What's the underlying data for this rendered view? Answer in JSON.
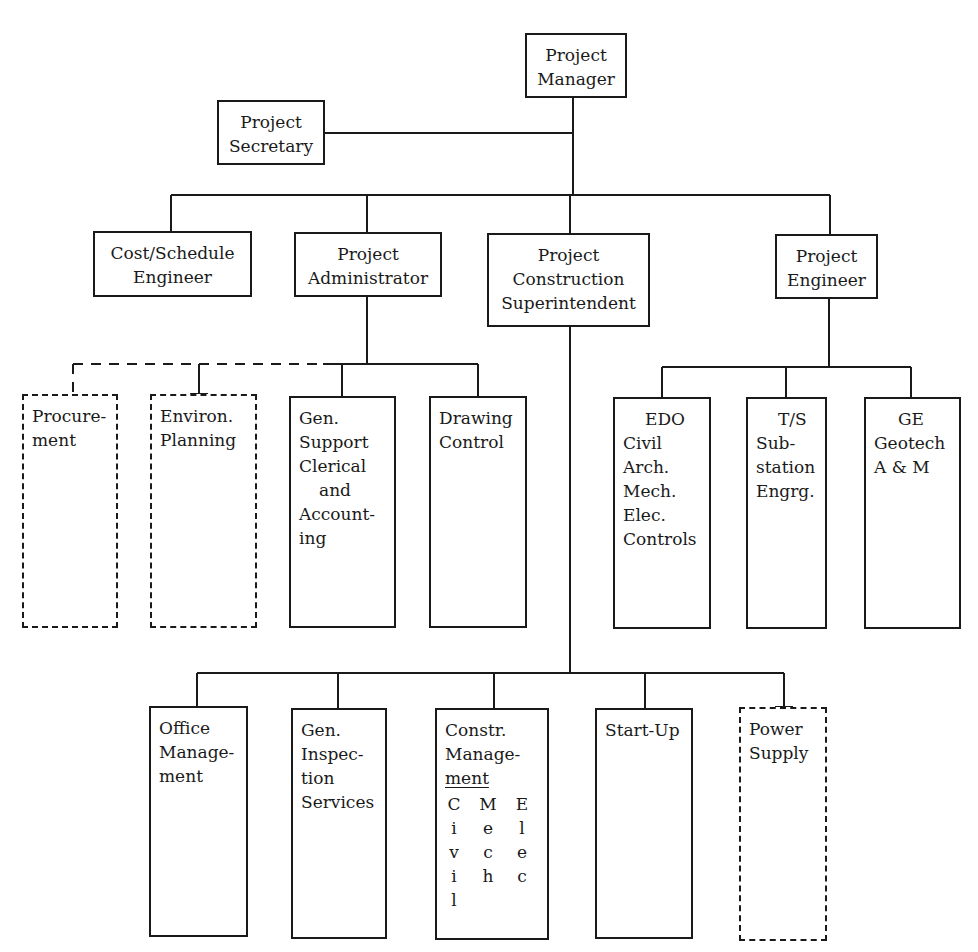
{
  "colors": {
    "line": "#1a1a1a",
    "background": "#ffffff"
  },
  "nodes": {
    "project_manager": {
      "lines": [
        "Project",
        "Manager"
      ],
      "style": "solid"
    },
    "project_secretary": {
      "lines": [
        "Project",
        "Secretary"
      ],
      "style": "solid"
    },
    "cost_schedule_engineer": {
      "lines": [
        "Cost/Schedule",
        "Engineer"
      ],
      "style": "solid"
    },
    "project_administrator": {
      "lines": [
        "Project",
        "Administrator"
      ],
      "style": "solid"
    },
    "construction_superintendent": {
      "lines": [
        "Project",
        "Construction",
        "Superintendent"
      ],
      "style": "solid"
    },
    "project_engineer": {
      "lines": [
        "Project",
        "Engineer"
      ],
      "style": "solid"
    },
    "procurement": {
      "lines": [
        "Procure-",
        "ment"
      ],
      "style": "dashed"
    },
    "environ_planning": {
      "lines": [
        "Environ.",
        "Planning"
      ],
      "style": "dashed"
    },
    "gen_support": {
      "lines": [
        "Gen.",
        "Support",
        "Clerical",
        "and",
        "Account-",
        "ing"
      ],
      "style": "solid"
    },
    "drawing_control": {
      "lines": [
        "Drawing",
        "Control"
      ],
      "style": "solid"
    },
    "edo": {
      "lines": [
        "EDO",
        "Civil",
        "Arch.",
        "Mech.",
        "Elec.",
        "Controls"
      ],
      "style": "solid"
    },
    "ts": {
      "lines": [
        "T/S",
        "Sub-",
        "station",
        "Engrg."
      ],
      "style": "solid"
    },
    "ge": {
      "lines": [
        "GE",
        "Geotech",
        "A & M"
      ],
      "style": "solid"
    },
    "office_management": {
      "lines": [
        "Office",
        "Manage-",
        "ment"
      ],
      "style": "solid"
    },
    "gen_inspection": {
      "lines": [
        "Gen.",
        "Inspec-",
        "tion",
        "Services"
      ],
      "style": "solid"
    },
    "constr_management": {
      "lines": [
        "Constr.",
        "Manage-",
        "ment"
      ],
      "columns": [
        [
          "C",
          "i",
          "v",
          "i",
          "l"
        ],
        [
          "M",
          "e",
          "c",
          "h"
        ],
        [
          "E",
          "l",
          "e",
          "c"
        ]
      ],
      "style": "solid"
    },
    "start_up": {
      "lines": [
        "Start-Up"
      ],
      "style": "solid"
    },
    "power_supply": {
      "lines": [
        "Power",
        "Supply"
      ],
      "style": "dashed"
    }
  }
}
